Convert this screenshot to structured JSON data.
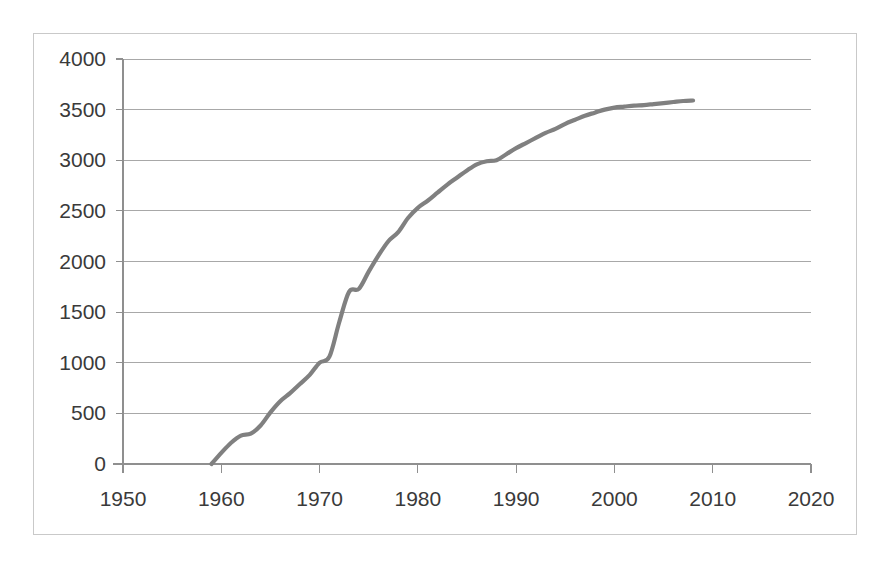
{
  "chart_data": {
    "type": "line",
    "title": "",
    "subtitle": "",
    "xlabel": "",
    "ylabel": "",
    "xlim": [
      1950,
      2020
    ],
    "ylim": [
      0,
      4000
    ],
    "grid": true,
    "legend": null,
    "legend_position": "none",
    "xticks": [
      1950,
      1960,
      1970,
      1980,
      1990,
      2000,
      2010,
      2020
    ],
    "yticks": [
      0,
      500,
      1000,
      1500,
      2000,
      2500,
      3000,
      3500,
      4000
    ],
    "series": [
      {
        "name": "Cumulative total",
        "color": "#808080",
        "x": [
          1959,
          1960,
          1961,
          1962,
          1963,
          1964,
          1965,
          1966,
          1967,
          1968,
          1969,
          1970,
          1971,
          1972,
          1973,
          1974,
          1975,
          1976,
          1977,
          1978,
          1979,
          1980,
          1981,
          1982,
          1983,
          1984,
          1985,
          1986,
          1987,
          1988,
          1989,
          1990,
          1991,
          1992,
          1993,
          1994,
          1995,
          1996,
          1997,
          1998,
          1999,
          2000,
          2001,
          2002,
          2003,
          2004,
          2005,
          2006,
          2007,
          2008
        ],
        "values": [
          0,
          110,
          210,
          280,
          300,
          380,
          510,
          620,
          700,
          790,
          880,
          1000,
          1060,
          1400,
          1700,
          1730,
          1900,
          2060,
          2200,
          2290,
          2430,
          2530,
          2600,
          2680,
          2760,
          2830,
          2900,
          2960,
          2990,
          3000,
          3060,
          3120,
          3170,
          3220,
          3270,
          3310,
          3360,
          3400,
          3440,
          3470,
          3500,
          3520,
          3530,
          3540,
          3545,
          3555,
          3565,
          3575,
          3585,
          3590
        ]
      }
    ],
    "annotations": []
  },
  "axes": {
    "y_tick_labels": [
      "4000",
      "3500",
      "3000",
      "2500",
      "2000",
      "1500",
      "1000",
      "500",
      "0"
    ],
    "x_tick_labels": [
      "1950",
      "1960",
      "1970",
      "1980",
      "1990",
      "2000",
      "2010",
      "2020"
    ]
  },
  "style": {
    "line_color": "#808080",
    "gridline_color": "#9e9e9e",
    "axis_color": "#8f8f8f",
    "border_color": "#c9c9c9",
    "text_color": "#3a3a3a",
    "background": "#ffffff"
  }
}
